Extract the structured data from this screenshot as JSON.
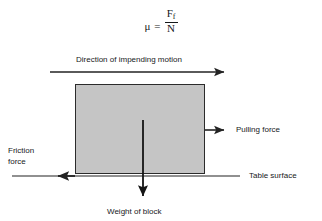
{
  "figure": {
    "background_color": "#ffffff",
    "line_color": "#232323",
    "block_fill_color": "#c5c5c5",
    "block_border_color": "#2b2b2b"
  },
  "formula": {
    "symbol": "μ",
    "equals": "=",
    "numerator": "F",
    "numerator_subscript": "f",
    "denominator": "N",
    "full_text": "μ = F_f / N"
  },
  "labels": {
    "direction_of_motion": "Direction of impending motion",
    "pulling_force": "Pulling force",
    "friction_force_line1": "Friction",
    "friction_force_line2": "force",
    "table_surface": "Table surface",
    "weight_of_block": "Weight of block"
  },
  "diagram_elements": {
    "block": {
      "name": "block",
      "x": 75,
      "y": 84,
      "width": 130,
      "height": 90
    },
    "motion_arrow": {
      "name": "direction-of-impending-motion-arrow",
      "direction": "right",
      "x1": 50,
      "y1": 72,
      "x2": 230,
      "y2": 72
    },
    "pulling_force_arrow": {
      "name": "pulling-force-arrow",
      "direction": "right",
      "x1": 205,
      "y1": 130,
      "x2": 228,
      "y2": 130
    },
    "friction_force_arrow": {
      "name": "friction-force-arrow",
      "direction": "left",
      "x1": 57,
      "y1": 176,
      "x2": 12,
      "y2": 176
    },
    "weight_arrow": {
      "name": "weight-of-block-arrow",
      "direction": "down",
      "x1": 143,
      "y1": 120,
      "x2": 143,
      "y2": 201
    },
    "table_surface_line": {
      "name": "table-surface-line",
      "x1": 12,
      "y1": 176,
      "x2": 240,
      "y2": 176
    }
  }
}
